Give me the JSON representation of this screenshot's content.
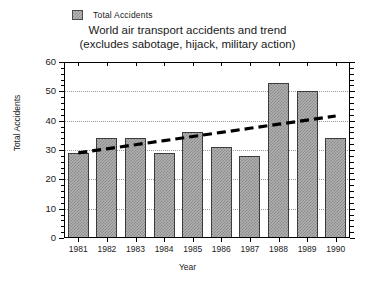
{
  "legend": {
    "entries": [
      {
        "label": "Total Accidents",
        "swatch_name": "bar-series-swatch",
        "color": "#b0b0b0"
      }
    ]
  },
  "title": {
    "line1": "World air transport accidents and trend",
    "line2": "(excludes sabotage, hijack, military action)"
  },
  "axes": {
    "x_label": "Year",
    "y_label": "Total Accidents"
  },
  "chart_data": {
    "type": "bar",
    "title": "World air transport accidents and trend (excludes sabotage, hijack, military action)",
    "xlabel": "Year",
    "ylabel": "Total Accidents",
    "categories": [
      "1981",
      "1982",
      "1983",
      "1984",
      "1985",
      "1986",
      "1987",
      "1988",
      "1989",
      "1990"
    ],
    "values": [
      29,
      34,
      34,
      29,
      36,
      31,
      28,
      53,
      50,
      34
    ],
    "series": [
      {
        "name": "Total Accidents",
        "type": "bar",
        "values": [
          29,
          34,
          34,
          29,
          36,
          31,
          28,
          53,
          50,
          34
        ]
      },
      {
        "name": "Trend",
        "type": "line",
        "style": "dashed",
        "color": "#000000",
        "values": [
          29,
          30.4,
          31.8,
          33.2,
          34.6,
          36.0,
          37.4,
          38.8,
          40.2,
          41.6
        ]
      }
    ],
    "ylim": [
      0,
      60
    ],
    "ytick_labels": [
      "0",
      "10",
      "20",
      "30",
      "40",
      "50",
      "60"
    ],
    "ytick_values": [
      0,
      10,
      20,
      30,
      40,
      50,
      60
    ],
    "y_minor_tick_step": 2,
    "xtick_labels": [
      "1981",
      "1982",
      "1983",
      "1984",
      "1985",
      "1986",
      "1987",
      "1988",
      "1989",
      "1990"
    ],
    "grid": "horizontal-dotted",
    "legend_position": "top-left",
    "bar_color": "#b0b0b0",
    "bar_edge_color": "#3c3c3c"
  }
}
